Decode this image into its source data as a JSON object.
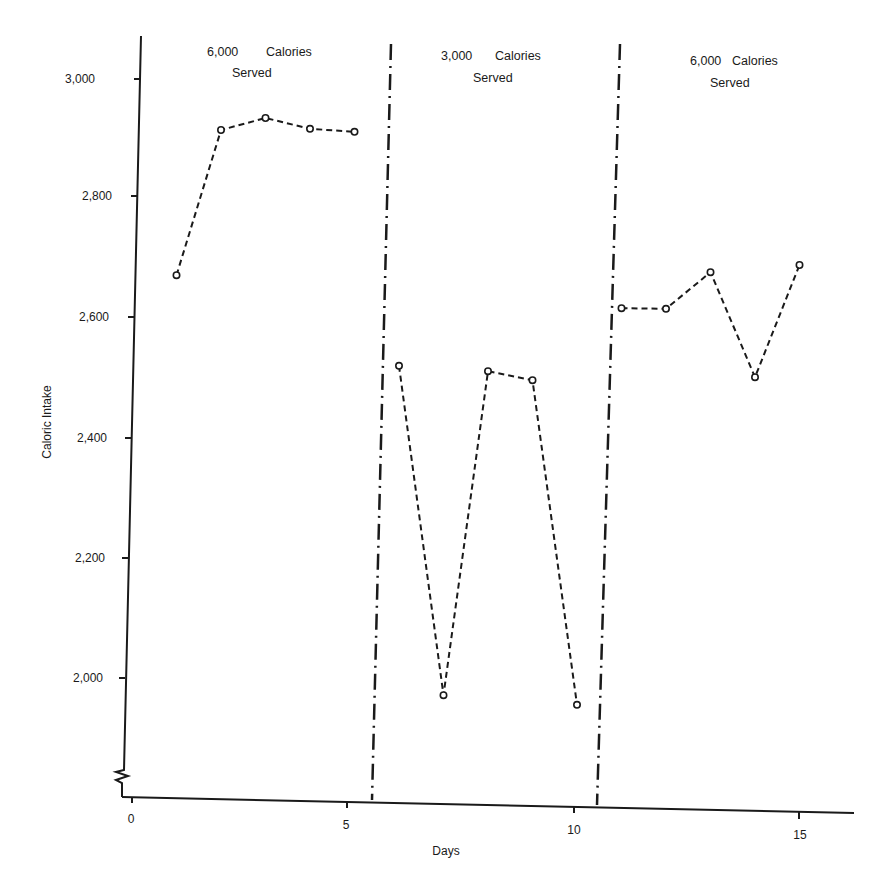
{
  "chart_data": {
    "type": "line",
    "title": "",
    "xlabel": "Days",
    "ylabel": "Caloric Intake",
    "x_ticks": [
      0,
      5,
      10,
      15
    ],
    "y_ticks": [
      2000,
      2200,
      2400,
      2600,
      2800,
      3000
    ],
    "y_tick_labels": [
      "2,000",
      "2,200",
      "2,400",
      "2,600",
      "2,800",
      "3,000"
    ],
    "xlim": [
      0,
      16
    ],
    "ylim": [
      1800,
      3050
    ],
    "y_axis_break": true,
    "grid": false,
    "legend": null,
    "line_style": "dashed with open circle markers",
    "phase_dividers": [
      5.5,
      10.5
    ],
    "phases": [
      {
        "label_line1": "6,000   Calories",
        "label_line2": "Served",
        "days": [
          1,
          2,
          3,
          4,
          5
        ],
        "values": [
          2668,
          2910,
          2930,
          2912,
          2907
        ]
      },
      {
        "label_line1": "3,000   Calories",
        "label_line2": "Served",
        "days": [
          6,
          7,
          8,
          9,
          10
        ],
        "values": [
          2517,
          1968,
          2508,
          2493,
          1952
        ]
      },
      {
        "label_line1": "6,000  Calories",
        "label_line2": "Served",
        "days": [
          11,
          12,
          13,
          14,
          15
        ],
        "values": [
          2613,
          2612,
          2673,
          2498,
          2685
        ]
      }
    ],
    "series": [
      {
        "name": "Caloric Intake",
        "x": [
          1,
          2,
          3,
          4,
          5,
          6,
          7,
          8,
          9,
          10,
          11,
          12,
          13,
          14,
          15
        ],
        "values": [
          2668,
          2910,
          2930,
          2912,
          2907,
          2517,
          1968,
          2508,
          2493,
          1952,
          2613,
          2612,
          2673,
          2498,
          2685
        ]
      }
    ]
  },
  "labels": {
    "xlabel": "Days",
    "ylabel": "Caloric Intake",
    "phase1_line1": "6,000",
    "phase1_line1b": "Calories",
    "phase1_line2": "Served",
    "phase2_line1": "3,000",
    "phase2_line1b": "Calories",
    "phase2_line2": "Served",
    "phase3_line1": "6,000",
    "phase3_line1b": "Calories",
    "phase3_line2": "Served",
    "x_tick_0": "0",
    "x_tick_5": "5",
    "x_tick_10": "10",
    "x_tick_15": "15",
    "y_tick_3000": "3,000",
    "y_tick_2800": "2,800",
    "y_tick_2600": "2,600",
    "y_tick_2400": "2,400",
    "y_tick_2200": "2,200",
    "y_tick_2000": "2,000"
  }
}
